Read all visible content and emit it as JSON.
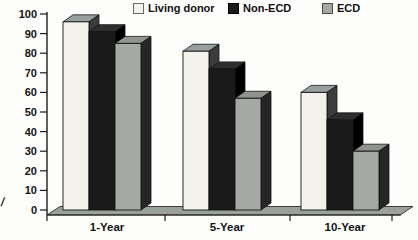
{
  "chart_data": {
    "type": "bar",
    "style": "3d-grouped-bars",
    "title": "",
    "xlabel": "",
    "ylabel": "",
    "categories": [
      "1-Year",
      "5-Year",
      "10-Year"
    ],
    "series": [
      {
        "name": "Living donor",
        "values": [
          96,
          81,
          60
        ],
        "color": "#f3f2ed",
        "top_color": "#96a0a0",
        "side_color": "#3c3c3c",
        "legend_border": "#6a6a6a"
      },
      {
        "name": "Non-ECD",
        "values": [
          91,
          72,
          46
        ],
        "color": "#1a1a1a",
        "top_color": "#2e2e2e",
        "side_color": "#000000",
        "legend_border": "#000000"
      },
      {
        "name": "ECD",
        "values": [
          85,
          57,
          30
        ],
        "color": "#a5a9a4",
        "top_color": "#90948f",
        "side_color": "#262626",
        "legend_border": "#4a4a4a"
      }
    ],
    "y_ticks": [
      0,
      10,
      20,
      30,
      40,
      50,
      60,
      70,
      80,
      90,
      100
    ],
    "ylim": [
      0,
      100
    ],
    "grid": false,
    "legend_position": "top",
    "axis_color": "#1c1c1c",
    "floor_color": "#9aa09a"
  },
  "stray_mark": "/"
}
